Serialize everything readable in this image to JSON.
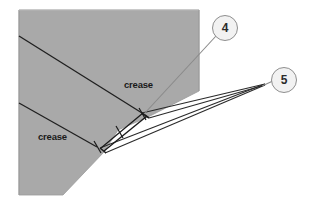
{
  "figure": {
    "type": "origami-folding-diagram",
    "background_color": "#ffffff",
    "paper": {
      "fill_color": "#a8a8a8",
      "edge_color": "#8f8f8f",
      "description": "gray folded paper sheet"
    },
    "line_color": "#1f1f1f",
    "labels": {
      "crease_upper": "crease",
      "crease_lower": "crease"
    },
    "callouts": [
      {
        "id": "callout-4",
        "text": "4",
        "circle_fill": "#f2f2f2",
        "circle_stroke": "#8e8e8e",
        "leader_from": [
          142,
          113
        ],
        "leader_to": [
          216,
          34
        ]
      },
      {
        "id": "callout-5",
        "text": "5",
        "circle_fill": "#f2f2f2",
        "circle_stroke": "#8e8e8e",
        "leader_from": [
          262,
          84
        ],
        "leader_to": [
          274,
          80
        ]
      }
    ],
    "geometry": {
      "paper_polygon": "19,10 199,10 199,91 103,152 63,195 19,195",
      "crease_upper": [
        [
          19,
          36
        ],
        [
          141,
          113
        ]
      ],
      "crease_lower": [
        [
          19,
          103
        ],
        [
          95,
          146
        ]
      ],
      "fold_bands": [
        [
          [
            100,
            148
          ],
          [
            262,
            84
          ]
        ],
        [
          [
            104,
            152
          ],
          [
            263,
            85
          ]
        ],
        [
          [
            141,
            114
          ],
          [
            263,
            84
          ]
        ],
        [
          [
            148,
            117
          ],
          [
            262,
            85
          ]
        ]
      ],
      "tick_marks": [
        [
          [
            117,
            126
          ],
          [
            122,
            136
          ]
        ],
        [
          [
            142,
            109
          ],
          [
            147,
            122
          ]
        ],
        [
          [
            96,
            142
          ],
          [
            101,
            152
          ]
        ]
      ]
    }
  }
}
